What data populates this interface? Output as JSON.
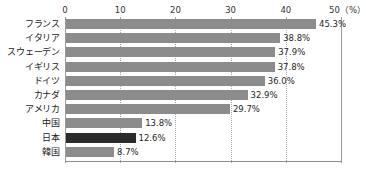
{
  "header": {
    "cropped_sliver_text": "・・ ・ ・・・・・ ・・"
  },
  "chart_data": {
    "type": "bar",
    "orientation": "horizontal",
    "title": "",
    "xlabel": "(%)",
    "ylabel": "",
    "xlim": [
      0,
      50
    ],
    "grid": true,
    "grid_axis": "x",
    "legend": false,
    "unit_label": "50（%）",
    "axis_ticks": [
      {
        "value": 0,
        "label": "0"
      },
      {
        "value": 10,
        "label": "10"
      },
      {
        "value": 20,
        "label": "20"
      },
      {
        "value": 30,
        "label": "30"
      },
      {
        "value": 40,
        "label": "40"
      },
      {
        "value": 50,
        "label": "50（%）"
      }
    ],
    "categories": [
      "フランス",
      "イタリア",
      "スウェーデン",
      "イギリス",
      "ドイツ",
      "カナダ",
      "アメリカ",
      "中国",
      "日本",
      "韓国"
    ],
    "values": [
      45.3,
      38.8,
      37.9,
      37.8,
      36.0,
      32.9,
      29.7,
      13.8,
      12.6,
      8.7
    ],
    "value_labels": [
      "45.3%",
      "38.8%",
      "37.9%",
      "37.8%",
      "36.0%",
      "32.9%",
      "29.7%",
      "13.8%",
      "12.6%",
      "8.7%"
    ],
    "highlight_index": 8,
    "colors": {
      "bar": "#8c8c8c",
      "bar_highlight": "#2b2b2b",
      "gridline": "#a8a8a8",
      "axisline": "#9a9a9a",
      "text": "#1a1a1a"
    }
  }
}
